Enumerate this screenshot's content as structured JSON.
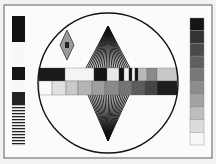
{
  "test_pattern": {
    "frame": {
      "x": 4,
      "y": 5,
      "w": 208,
      "h": 153,
      "stroke": "#777777",
      "fill": "#fbfbfb"
    },
    "circle": {
      "cx": 108,
      "cy": 83,
      "r": 70,
      "stroke": "#111111"
    },
    "left_strip": {
      "x": 12,
      "w": 13,
      "blocks": [
        {
          "y": 16,
          "h": 26,
          "fill": "#111111"
        },
        {
          "y": 42,
          "h": 25,
          "fill": "#f8f8f8"
        },
        {
          "y": 67,
          "h": 13,
          "fill": "#151515"
        },
        {
          "y": 80,
          "h": 12,
          "fill": "#f8f8f8"
        },
        {
          "y": 92,
          "h": 12,
          "fill": "#222222"
        }
      ],
      "stripes": {
        "y": 104,
        "h": 42,
        "count": 14,
        "dark": "#222222",
        "light": "#f0f0f0"
      }
    },
    "right_strip": {
      "x": 190,
      "w": 14,
      "y": 18,
      "h": 127,
      "steps": [
        "#151515",
        "#333333",
        "#4a4a4a",
        "#5f5f5f",
        "#777777",
        "#8c8c8c",
        "#a3a3a3",
        "#bdbdbd",
        "#dcdcdc",
        "#f7f7f7"
      ]
    },
    "diamond": {
      "cx": 67,
      "cy": 45,
      "hw": 7,
      "hh": 15,
      "fill": "#9a9a9a",
      "center": "#222222"
    },
    "top_fan": {
      "apex_x": 108,
      "apex_y": 26,
      "base_y": 68,
      "base_x1": 86,
      "base_x2": 130,
      "lines": 22
    },
    "bottom_fan": {
      "apex_x": 108,
      "apex_y": 141,
      "base_y": 95,
      "base_x1": 88,
      "base_x2": 129,
      "lines": 22
    },
    "band_top": {
      "y": 68,
      "h": 13,
      "segments": [
        {
          "x": 39,
          "w": 26,
          "fill": "#1a1a1a"
        },
        {
          "x": 65,
          "w": 29,
          "fill": "#f4f4f4"
        },
        {
          "x": 94,
          "w": 13,
          "fill": "#141414"
        },
        {
          "x": 107,
          "w": 12,
          "fill": "#e8e8e8"
        },
        {
          "x": 119,
          "w": 5,
          "fill": "#111111"
        },
        {
          "x": 124,
          "w": 5,
          "fill": "#f0f0f0"
        },
        {
          "x": 129,
          "w": 3,
          "fill": "#111111"
        },
        {
          "x": 132,
          "w": 3,
          "fill": "#f0f0f0"
        },
        {
          "x": 135,
          "w": 3,
          "fill": "#111111"
        },
        {
          "x": 138,
          "w": 9,
          "fill": "#b8b8b8"
        },
        {
          "x": 147,
          "w": 10,
          "fill": "#8a8a8a"
        },
        {
          "x": 157,
          "w": 20,
          "fill": "#c8c8c8"
        }
      ]
    },
    "band_bottom": {
      "y": 81,
      "h": 14,
      "segments": [
        {
          "x": 39,
          "w": 13,
          "fill": "#fafafa"
        },
        {
          "x": 52,
          "w": 14,
          "fill": "#e0e0e0"
        },
        {
          "x": 66,
          "w": 12,
          "fill": "#c9c9c9"
        },
        {
          "x": 78,
          "w": 14,
          "fill": "#b4b4b4"
        },
        {
          "x": 92,
          "w": 13,
          "fill": "#9f9f9f"
        },
        {
          "x": 105,
          "w": 14,
          "fill": "#8a8a8a"
        },
        {
          "x": 119,
          "w": 13,
          "fill": "#747474"
        },
        {
          "x": 132,
          "w": 13,
          "fill": "#5c5c5c"
        },
        {
          "x": 145,
          "w": 12,
          "fill": "#444444"
        },
        {
          "x": 157,
          "w": 20,
          "fill": "#1e1e1e"
        }
      ]
    }
  }
}
